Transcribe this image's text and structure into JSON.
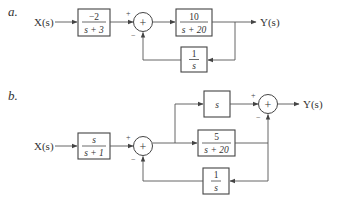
{
  "diagrams": {
    "a": {
      "part_label": "a.",
      "input_label": "X(s)",
      "output_label": "Y(s)",
      "block1": {
        "num": "−2",
        "den": "s + 3"
      },
      "summer": {
        "symbol": "+",
        "in_sign": "+",
        "fb_sign": "−"
      },
      "block2": {
        "num": "10",
        "den": "s + 20"
      },
      "feedback_block": {
        "num": "1",
        "den": "s"
      }
    },
    "b": {
      "part_label": "b.",
      "input_label": "X(s)",
      "output_label": "Y(s)",
      "block1": {
        "num": "s",
        "den": "s + 1"
      },
      "summer1": {
        "symbol": "+",
        "in_sign": "+",
        "fb_sign": "−"
      },
      "upper_block": {
        "label": "s"
      },
      "middle_block": {
        "num": "5",
        "den": "s + 20"
      },
      "summer2": {
        "symbol": "+",
        "in_sign": "+",
        "fb_sign": "−"
      },
      "feedback_block": {
        "num": "1",
        "den": "s"
      }
    }
  }
}
